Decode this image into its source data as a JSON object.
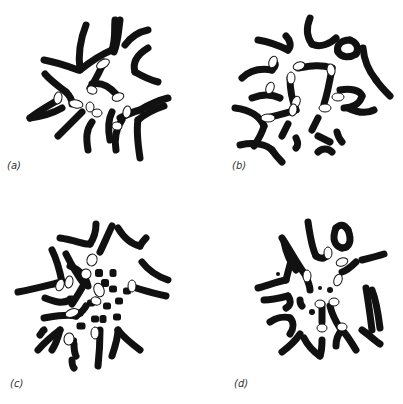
{
  "figure": {
    "ink_color": "#111111",
    "background": "#ffffff",
    "panels": [
      {
        "id": "a",
        "label": "(a)",
        "label_pos": [
          7,
          160
        ],
        "chromosomes": [
          "M80 70 C78 55 80 40 86 25",
          "M80 70 C90 62 100 55 112 50",
          "M112 50 C116 38 114 30 115 20",
          "M120 20 C118 35 118 42 114 52",
          "M44 60 C55 62 65 65 78 70",
          "M90 88 C96 80 100 70 104 62",
          "M125 45 C130 38 138 32 148 30",
          "M135 72 C132 62 138 54 148 48",
          "M135 72 C142 76 150 80 158 82",
          "M45 74 C50 80 58 86 66 92",
          "M66 92 C70 96 72 100 72 104",
          "M92 84 C100 82 108 85 116 94",
          "M30 118 C40 110 50 105 58 100",
          "M30 118 C45 116 55 112 62 108",
          "M58 136 C66 128 74 120 82 112",
          "M88 150 C86 138 86 130 92 122",
          "M110 140 C108 130 108 120 112 112",
          "M120 118 C126 115 132 112 140 110",
          "M140 110 C150 104 160 100 168 98",
          "M140 158 C138 145 136 132 138 120",
          "M138 120 C145 114 152 110 164 106",
          "M116 150 C114 140 116 128 122 120"
        ],
        "pale_segments": [
          [
            103,
            64,
            7,
            4,
            -30
          ],
          [
            58,
            98,
            4,
            6,
            10
          ],
          [
            76,
            104,
            7,
            4,
            10
          ],
          [
            92,
            90,
            5,
            4,
            20
          ],
          [
            118,
            97,
            6,
            4,
            -20
          ],
          [
            90,
            107,
            4,
            5,
            0
          ],
          [
            97,
            113,
            5,
            4,
            0
          ],
          [
            127,
            112,
            4,
            6,
            10
          ],
          [
            117,
            126,
            5,
            4,
            10
          ]
        ]
      },
      {
        "id": "b",
        "label": "(b)",
        "label_pos": [
          232,
          160
        ],
        "chromosomes": [
          "M258 40 C270 42 280 46 288 50",
          "M288 50 C292 46 290 40 286 36",
          "M310 18 C306 28 306 36 312 44",
          "M312 44 C320 48 330 44 336 38",
          "M350 40 C340 40 336 46 338 52",
          "M338 52 C342 58 350 58 356 54",
          "M356 54 C360 48 356 42 350 40",
          "M363 48 C364 60 368 70 376 80",
          "M376 80 C380 86 386 92 390 96",
          "M242 78 C250 70 260 68 272 70",
          "M272 70 C276 66 276 64 274 62",
          "M252 98 C262 94 272 94 280 98",
          "M235 108 C250 110 260 116 264 126",
          "M264 126 C262 134 258 140 254 146",
          "M240 145 C254 142 266 144 272 150",
          "M272 150 C276 156 280 160 282 162",
          "M298 68 C310 66 320 64 332 68",
          "M290 78 C290 90 292 100 296 110",
          "M296 110 C284 114 274 116 266 118",
          "M332 68 C330 80 328 92 324 104",
          "M340 90 C350 88 360 90 362 96",
          "M362 96 C360 104 352 108 344 108",
          "M348 108 C356 112 366 114 374 110",
          "M288 124 C286 128 284 132 282 136",
          "M318 118 C316 122 314 126 312 130",
          "M296 138 C298 142 298 146 296 148",
          "M318 136 C322 138 326 140 330 142",
          "M337 132 C338 136 340 140 342 142",
          "M318 152 C322 148 328 148 332 152"
        ],
        "pale_segments": [
          [
            273,
            62,
            4,
            6,
            20
          ],
          [
            299,
            66,
            6,
            4,
            -20
          ],
          [
            270,
            88,
            4,
            6,
            20
          ],
          [
            291,
            78,
            4,
            6,
            0
          ],
          [
            331,
            70,
            4,
            6,
            -10
          ],
          [
            338,
            97,
            6,
            4,
            0
          ],
          [
            325,
            108,
            6,
            4,
            0
          ],
          [
            296,
            102,
            4,
            6,
            20
          ],
          [
            293,
            110,
            4,
            6,
            10
          ],
          [
            268,
            118,
            7,
            4,
            0
          ]
        ]
      },
      {
        "id": "c",
        "label": "(c)",
        "label_pos": [
          10,
          378
        ],
        "chromosomes": [
          "M60 238 C75 240 85 245 90 244",
          "M90 244 C94 238 96 230 96 224",
          "M100 252 C104 244 108 234 112 226",
          "M118 228 C124 238 130 244 140 246",
          "M140 246 C142 242 144 240 146 238",
          "M52 250 C58 262 60 272 62 282",
          "M62 282 C52 284 40 288 18 292",
          "M66 254 C72 266 78 276 84 284",
          "M84 284 C80 292 76 298 72 304",
          "M70 266 C80 270 86 278 88 286",
          "M45 298 C55 302 62 304 70 300",
          "M142 262 C148 270 156 276 168 280",
          "M136 288 C148 292 158 294 166 296",
          "M44 318 C56 316 66 314 76 316",
          "M76 316 C82 312 84 310 86 306",
          "M38 350 C45 342 52 336 60 330",
          "M60 330 C58 338 56 344 52 350",
          "M40 335 C42 333 42 331 44 330",
          "M100 330 C100 340 100 348 98 366",
          "M112 356 C116 344 118 336 118 330",
          "M118 330 C124 338 132 344 140 350",
          "M74 344 C74 348 74 352 76 356",
          "M72 360 C72 364 72 366 74 368"
        ],
        "blocks": [
          [
            84,
            282,
            6,
            6
          ],
          [
            70,
            298,
            6,
            5
          ],
          [
            78,
            312,
            7,
            5
          ],
          [
            80,
            325,
            7,
            5
          ],
          [
            72,
            340,
            6,
            5
          ],
          [
            98,
            272,
            6,
            6
          ],
          [
            104,
            282,
            6,
            6
          ],
          [
            112,
            272,
            5,
            6
          ],
          [
            112,
            288,
            6,
            5
          ],
          [
            118,
            300,
            6,
            5
          ],
          [
            106,
            305,
            6,
            5
          ],
          [
            102,
            318,
            5,
            6
          ],
          [
            116,
            316,
            6,
            5
          ],
          [
            90,
            302,
            6,
            5
          ],
          [
            94,
            318,
            6,
            5
          ],
          [
            96,
            330,
            5,
            5
          ],
          [
            126,
            290,
            6,
            5
          ]
        ],
        "pale_segments": [
          [
            92,
            260,
            5,
            6,
            20
          ],
          [
            86,
            274,
            5,
            5,
            -10
          ],
          [
            60,
            285,
            4,
            6,
            20
          ],
          [
            69,
            282,
            4,
            6,
            10
          ],
          [
            99,
            290,
            5,
            7,
            -20
          ],
          [
            96,
            301,
            5,
            4,
            20
          ],
          [
            72,
            313,
            7,
            4,
            -20
          ],
          [
            132,
            286,
            4,
            6,
            0
          ],
          [
            69,
            339,
            5,
            6,
            10
          ],
          [
            95,
            333,
            4,
            6,
            0
          ]
        ]
      },
      {
        "id": "d",
        "label": "(d)",
        "label_pos": [
          234,
          378
        ],
        "chromosomes": [
          "M308 222 C310 236 312 248 316 256",
          "M316 256 C322 260 326 258 328 254",
          "M336 228 C332 238 334 246 342 248",
          "M342 248 C350 248 352 240 348 230",
          "M348 230 C344 224 340 224 336 228",
          "M282 238 C290 250 296 262 306 276",
          "M306 276 C308 282 310 286 310 290",
          "M284 242 C286 252 290 262 296 270",
          "M258 288 C266 286 276 282 286 280",
          "M286 280 C288 272 290 264 292 258",
          "M264 300 C272 300 280 298 288 296",
          "M288 296 C292 302 290 306 286 308",
          "M270 322 C276 318 284 316 290 318",
          "M290 318 C294 322 294 328 290 334",
          "M282 352 C290 346 296 340 300 334",
          "M304 338 C308 346 314 352 320 356",
          "M320 356 C322 350 322 344 322 340",
          "M336 346 C336 340 338 334 342 330",
          "M342 330 C348 336 352 344 356 350",
          "M362 330 C368 334 374 340 380 344",
          "M362 260 C370 258 378 256 384 254",
          "M372 290 C376 300 378 312 380 328",
          "M366 288 C368 300 370 314 372 330",
          "M342 272 C348 270 352 266 356 262",
          "M322 304 C322 310 322 316 322 322",
          "M330 306 C332 314 336 322 340 328",
          "M300 300 C300 302 300 304 302 306"
        ],
        "dots": [
          [
            278,
            274,
            2
          ],
          [
            320,
            288,
            2
          ],
          [
            312,
            312,
            3
          ],
          [
            330,
            290,
            3
          ]
        ],
        "pale_segments": [
          [
            328,
            253,
            4,
            6,
            0
          ],
          [
            342,
            262,
            6,
            4,
            -20
          ],
          [
            338,
            280,
            4,
            6,
            20
          ],
          [
            307,
            276,
            4,
            6,
            0
          ],
          [
            320,
            304,
            5,
            4,
            0
          ],
          [
            334,
            302,
            5,
            4,
            0
          ],
          [
            322,
            328,
            5,
            4,
            0
          ],
          [
            342,
            327,
            5,
            4,
            0
          ]
        ]
      }
    ]
  }
}
